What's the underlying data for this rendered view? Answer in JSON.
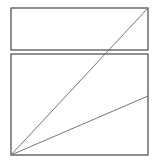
{
  "diagram": {
    "title": "",
    "colors": {
      "frame": "#555555",
      "diagonal": "#666666",
      "background": "#ffffff"
    },
    "shapes": [
      {
        "id": "top-panel",
        "kind": "rectangle",
        "label": ""
      },
      {
        "id": "bottom-panel",
        "kind": "rectangle",
        "label": ""
      }
    ],
    "lines": [
      {
        "id": "diagonal-steep",
        "from": "bottom-panel.bottom-left",
        "to": "top-panel.top-right",
        "label": ""
      },
      {
        "id": "diagonal-shallow",
        "from": "bottom-panel.bottom-left",
        "to": "bottom-panel.right-edge",
        "label": ""
      }
    ]
  }
}
